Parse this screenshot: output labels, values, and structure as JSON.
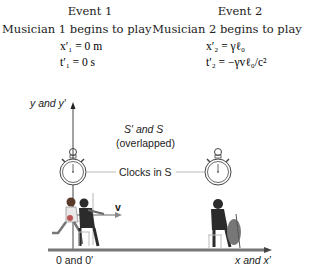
{
  "event1": {
    "title": "Event 1",
    "description": "Musician 1 begins to play",
    "x_eq": "x′₁ = 0 m",
    "t_eq": "t′₁ = 0 s"
  },
  "event2": {
    "title": "Event 2",
    "description": "Musician 2 begins to play",
    "x_eq": "x′₂ = γℓ₀",
    "t_eq": "t′₂ = −γvℓ₀/c²"
  },
  "labels": {
    "y_axis": "y and y′",
    "x_axis": "x and x′",
    "origin": "0 and 0′",
    "overlap_line1": "S′ and S",
    "overlap_line2": "(overlapped)",
    "clocks": "Clocks in S",
    "velocity": "v"
  },
  "colors": {
    "axis": "#555555",
    "text": "#222222",
    "figure_dark": "#2b2b2b",
    "figure_mid": "#8a8a8a",
    "figure_light": "#d0d0d0"
  }
}
